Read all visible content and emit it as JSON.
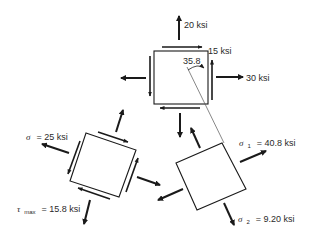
{
  "diagram": {
    "elements": {
      "original": {
        "labels": {
          "sigma_y": "20 ksi",
          "tau_xy": "15 ksi",
          "sigma_x": "30 ksi",
          "angle": "35.8"
        }
      },
      "max_shear": {
        "labels": {
          "sigma_symbol": "σ",
          "sigma_value": "= 25 ksi",
          "tau_symbol": "τ",
          "tau_sub": "max",
          "tau_value": "= 15.8 ksi"
        }
      },
      "principal": {
        "labels": {
          "sigma1_symbol": "σ",
          "sigma1_sub": "1",
          "sigma1_value": "= 40.8 ksi",
          "sigma2_symbol": "σ",
          "sigma2_sub": "2",
          "sigma2_value": "= 9.20 ksi"
        }
      }
    },
    "colors": {
      "stroke": "#1a1a1a",
      "text": "#2a2a2a",
      "background": "#ffffff"
    }
  }
}
